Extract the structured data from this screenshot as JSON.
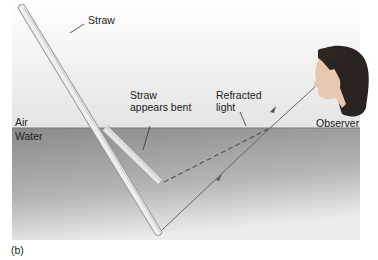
{
  "figure": {
    "panel_label": "(b)",
    "labels": {
      "straw": "Straw",
      "straw_bent_line1": "Straw",
      "straw_bent_line2": "appears bent",
      "refracted_line1": "Refracted",
      "refracted_line2": "light",
      "observer": "Observer",
      "air": "Air",
      "water": "Water"
    },
    "colors": {
      "air_top": "#ffffff",
      "air_bottom": "#e6e6e6",
      "water_top": "#8c8c8c",
      "water_bottom": "#e8e8e8",
      "straw": "#ececec",
      "ray": "#6a6a6a",
      "hair": "#2a2320",
      "skin": "#e8cdb8"
    }
  }
}
